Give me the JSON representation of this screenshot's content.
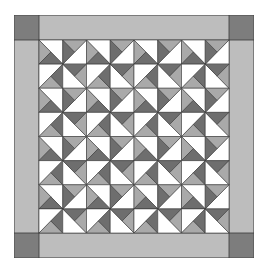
{
  "quilt": {
    "title": "Pinwheel quilt pattern",
    "grid": {
      "rows": 8,
      "cols": 8
    },
    "block": "pinwheel 2x2",
    "colors": {
      "background": "#ffffff",
      "border": "#bdbdbd",
      "corner": "#7d7d7d",
      "dark": "#6e6e6e",
      "medium": "#a9a9a9",
      "light": "#ffffff",
      "outline": "#3a3a3a"
    }
  }
}
